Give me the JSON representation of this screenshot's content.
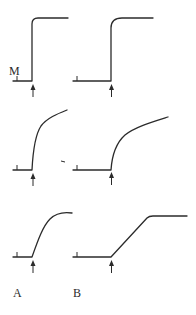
{
  "figure": {
    "marker_label": "M",
    "column_labels": [
      "A",
      "B"
    ],
    "stroke_color": "#2b2b2b",
    "background": "#ffffff",
    "panels": [
      {
        "row": 1,
        "column": "A",
        "shape": "instant step rise to plateau"
      },
      {
        "row": 1,
        "column": "B",
        "shape": "instant step rise to plateau"
      },
      {
        "row": 2,
        "column": "A",
        "shape": "fast rise then slow linear increase"
      },
      {
        "row": 2,
        "column": "B",
        "shape": "fast rise then slow linear increase"
      },
      {
        "row": 3,
        "column": "A",
        "shape": "gradual curved rise to peak"
      },
      {
        "row": 3,
        "column": "B",
        "shape": "linear ramp to plateau"
      }
    ],
    "stimulus_marker": "upward arrow at onset"
  }
}
